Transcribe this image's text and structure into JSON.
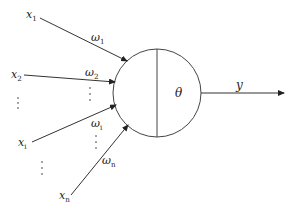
{
  "diagram": {
    "title": "",
    "neuron": {
      "threshold_label": "θ",
      "center": [
        157,
        93
      ],
      "radius": 44
    },
    "inputs": [
      {
        "label": "x",
        "sub": "1",
        "pos": [
          26,
          18
        ],
        "from": [
          40,
          18
        ],
        "to": [
          127,
          61
        ]
      },
      {
        "label": "x",
        "sub": "2",
        "pos": [
          11,
          78
        ],
        "from": [
          24,
          75
        ],
        "to": [
          115,
          82
        ]
      },
      {
        "label": "x",
        "sub": "i",
        "pos": [
          18,
          146
        ],
        "from": [
          32,
          142
        ],
        "to": [
          116,
          105
        ]
      },
      {
        "label": "x",
        "sub": "n",
        "pos": [
          59,
          199
        ],
        "from": [
          71,
          195
        ],
        "to": [
          128,
          125
        ]
      }
    ],
    "weights": [
      {
        "label": "ω",
        "sub": "1",
        "pos": [
          91,
          41
        ]
      },
      {
        "label": "ω",
        "sub": "2",
        "pos": [
          85,
          76
        ]
      },
      {
        "label": "ω",
        "sub": "i",
        "pos": [
          91,
          127
        ]
      },
      {
        "label": "ω",
        "sub": "n",
        "pos": [
          102,
          164
        ]
      }
    ],
    "ellipsis_dots": [
      {
        "x": 18,
        "ys": [
          98,
          103,
          108
        ]
      },
      {
        "x": 90,
        "ys": [
          88,
          94,
          100
        ]
      },
      {
        "x": 96,
        "ys": [
          136,
          142,
          148
        ]
      },
      {
        "x": 42,
        "ys": [
          162,
          168,
          174
        ]
      }
    ],
    "output": {
      "label": "y",
      "label_pos": [
        236,
        89
      ],
      "from": [
        201,
        93
      ],
      "to": [
        284,
        93
      ]
    },
    "colors": {
      "stroke": "#333333",
      "text": "#222222",
      "background": "#ffffff"
    }
  }
}
